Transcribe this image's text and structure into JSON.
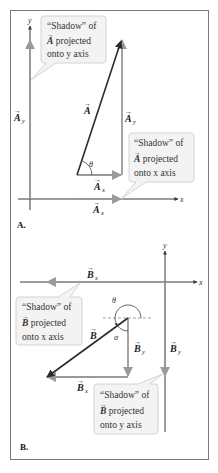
{
  "figure": {
    "panels": [
      {
        "id": "A",
        "label": "A.",
        "axes": {
          "x_label": "x",
          "y_label": "y"
        },
        "vector": {
          "name": "A",
          "label": "A"
        },
        "components": {
          "x": {
            "label": "A",
            "sub": "x"
          },
          "y": {
            "label": "A",
            "sub": "y"
          },
          "x_shadow": {
            "label": "A",
            "sub": "x"
          },
          "y_shadow": {
            "label": "A",
            "sub": "y"
          }
        },
        "angle": {
          "label": "θ"
        },
        "callouts": [
          {
            "line1": "“Shadow” of",
            "vec": "A",
            "line2": " projected",
            "line3": "onto y axis"
          },
          {
            "line1": "“Shadow” of",
            "vec": "A",
            "line2": " projected",
            "line3": "onto x axis"
          }
        ]
      },
      {
        "id": "B",
        "label": "B.",
        "axes": {
          "x_label": "x",
          "y_label": "y"
        },
        "vector": {
          "name": "B",
          "label": "B"
        },
        "components": {
          "x": {
            "label": "B",
            "sub": "x"
          },
          "y": {
            "label": "B",
            "sub": "y"
          },
          "x_shadow": {
            "label": "B",
            "sub": "x"
          },
          "y_shadow": {
            "label": "B",
            "sub": "y"
          }
        },
        "angles": {
          "theta": "θ",
          "alpha": "α"
        },
        "callouts": [
          {
            "line1": "“Shadow” of",
            "vec": "B",
            "line2": " projected",
            "line3": "onto x axis"
          },
          {
            "line1": "“Shadow” of",
            "vec": "B",
            "line2": " projected",
            "line3": "onto y axis"
          }
        ]
      }
    ],
    "colors": {
      "vector": "#2b2b2b",
      "component": "#9a9a9a",
      "axis": "#3a3a3a",
      "callout_fill": "#f3f3f3",
      "callout_stroke": "#d4d4d4",
      "frame": "#7a7a7a"
    }
  }
}
